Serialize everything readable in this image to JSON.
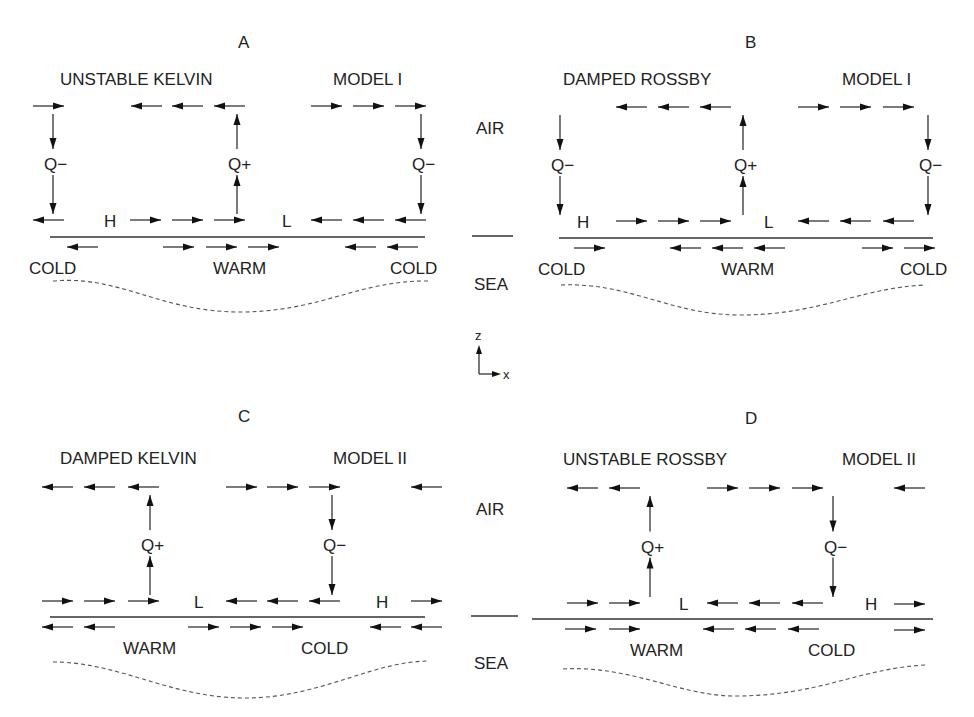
{
  "figure": {
    "center_labels": {
      "air_top": "AIR",
      "sea_top": "SEA",
      "air_bottom": "AIR",
      "sea_bottom": "SEA",
      "axis_z": "z",
      "axis_x": "x"
    },
    "panels": [
      {
        "id": "A",
        "letter": "A",
        "title": "UNSTABLE KELVIN",
        "model": "MODEL I",
        "origin": [
          0,
          0
        ],
        "letter_pos": [
          238,
          48
        ],
        "title_pos": [
          60,
          85
        ],
        "model_pos": [
          333,
          85
        ],
        "upper_arrows": [
          [
            33,
            106,
            "r"
          ],
          [
            131,
            106,
            "l"
          ],
          [
            172,
            106,
            "l"
          ],
          [
            214,
            106,
            "l"
          ],
          [
            311,
            106,
            "r"
          ],
          [
            353,
            106,
            "r"
          ],
          [
            395,
            106,
            "r"
          ]
        ],
        "verticals": [
          {
            "x": 53,
            "dir": "down",
            "label": "Q−"
          },
          {
            "x": 237,
            "dir": "up",
            "label": "Q+"
          },
          {
            "x": 421,
            "dir": "down",
            "label": "Q−"
          }
        ],
        "lower_air_arrows": [
          [
            33,
            220,
            "l"
          ],
          [
            130,
            220,
            "r"
          ],
          [
            172,
            220,
            "r"
          ],
          [
            214,
            220,
            "r"
          ],
          [
            311,
            220,
            "l"
          ],
          [
            353,
            220,
            "l"
          ],
          [
            395,
            220,
            "l"
          ]
        ],
        "pressure_labels": [
          {
            "text": "H",
            "x": 104
          },
          {
            "text": "L",
            "x": 282
          }
        ],
        "surface_line": [
          50,
          425
        ],
        "sea_arrows": [
          [
            67,
            247,
            "l"
          ],
          [
            163,
            247,
            "r"
          ],
          [
            206,
            247,
            "r"
          ],
          [
            248,
            247,
            "r"
          ],
          [
            345,
            247,
            "l"
          ],
          [
            387,
            247,
            "l"
          ]
        ],
        "sea_labels": [
          {
            "text": "COLD",
            "x": 29
          },
          {
            "text": "WARM",
            "x": 213
          },
          {
            "text": "COLD",
            "x": 390
          }
        ],
        "thermocline": "M53 281 C 120 275, 160 312, 240 312 C 320 312, 360 280, 428 281"
      },
      {
        "id": "B",
        "letter": "B",
        "title": "DAMPED ROSSBY",
        "model": "MODEL I",
        "origin": [
          0,
          0
        ],
        "letter_pos": [
          745,
          48
        ],
        "title_pos": [
          563,
          85
        ],
        "model_pos": [
          842,
          85
        ],
        "upper_arrows": [
          [
            616,
            107,
            "l"
          ],
          [
            658,
            107,
            "l"
          ],
          [
            700,
            107,
            "l"
          ],
          [
            798,
            107,
            "r"
          ],
          [
            840,
            107,
            "r"
          ],
          [
            883,
            107,
            "r"
          ]
        ],
        "verticals": [
          {
            "x": 560,
            "dir": "down",
            "label": "Q−"
          },
          {
            "x": 743,
            "dir": "up",
            "label": "Q+"
          },
          {
            "x": 928,
            "dir": "down",
            "label": "Q−"
          }
        ],
        "lower_air_arrows": [
          [
            616,
            221,
            "r"
          ],
          [
            658,
            221,
            "r"
          ],
          [
            700,
            221,
            "r"
          ],
          [
            798,
            221,
            "l"
          ],
          [
            840,
            221,
            "l"
          ],
          [
            883,
            221,
            "l"
          ]
        ],
        "pressure_labels": [
          {
            "text": "H",
            "x": 577
          },
          {
            "text": "L",
            "x": 764
          }
        ],
        "surface_line": [
          559,
          933
        ],
        "sea_arrows": [
          [
            574,
            248,
            "r"
          ],
          [
            670,
            248,
            "l"
          ],
          [
            712,
            248,
            "l"
          ],
          [
            754,
            248,
            "l"
          ],
          [
            862,
            248,
            "r"
          ],
          [
            904,
            248,
            "r"
          ]
        ],
        "sea_labels": [
          {
            "text": "COLD",
            "x": 538
          },
          {
            "text": "WARM",
            "x": 721
          },
          {
            "text": "COLD",
            "x": 900
          }
        ],
        "thermocline": "M561 285 C 630 282, 670 315, 740 315 C 820 315, 860 288, 925 285"
      },
      {
        "id": "C",
        "letter": "C",
        "title": "DAMPED KELVIN",
        "model": "MODEL II",
        "origin": [
          0,
          0
        ],
        "letter_pos": [
          238,
          422
        ],
        "title_pos": [
          60,
          464
        ],
        "model_pos": [
          333,
          464
        ],
        "upper_arrows": [
          [
            42,
            487,
            "l"
          ],
          [
            84,
            487,
            "l"
          ],
          [
            128,
            487,
            "l"
          ],
          [
            226,
            487,
            "r"
          ],
          [
            267,
            487,
            "r"
          ],
          [
            309,
            487,
            "r"
          ],
          [
            411,
            487,
            "l"
          ]
        ],
        "verticals": [
          {
            "x": 150,
            "dir": "up",
            "label": "Q+"
          },
          {
            "x": 332,
            "dir": "down",
            "label": "Q−"
          }
        ],
        "lower_air_arrows": [
          [
            42,
            601,
            "r"
          ],
          [
            84,
            601,
            "r"
          ],
          [
            128,
            601,
            "r"
          ],
          [
            226,
            601,
            "l"
          ],
          [
            267,
            601,
            "l"
          ],
          [
            309,
            601,
            "l"
          ],
          [
            411,
            601,
            "r"
          ]
        ],
        "pressure_labels": [
          {
            "text": "L",
            "x": 194
          },
          {
            "text": "H",
            "x": 376
          }
        ],
        "surface_line": [
          50,
          425
        ],
        "sea_arrows": [
          [
            42,
            627,
            "l"
          ],
          [
            84,
            627,
            "l"
          ],
          [
            188,
            627,
            "r"
          ],
          [
            230,
            627,
            "r"
          ],
          [
            272,
            627,
            "r"
          ],
          [
            370,
            627,
            "l"
          ],
          [
            411,
            627,
            "l"
          ]
        ],
        "sea_labels": [
          {
            "text": "WARM",
            "x": 123
          },
          {
            "text": "COLD",
            "x": 301
          }
        ],
        "thermocline": "M53 662 C 120 662, 170 698, 245 698 C 320 698, 370 662, 428 661"
      },
      {
        "id": "D",
        "letter": "D",
        "title": "UNSTABLE ROSSBY",
        "model": "MODEL II",
        "origin": [
          0,
          0
        ],
        "letter_pos": [
          745,
          424
        ],
        "title_pos": [
          563,
          465
        ],
        "model_pos": [
          842,
          465
        ],
        "upper_arrows": [
          [
            567,
            488,
            "l"
          ],
          [
            609,
            488,
            "l"
          ],
          [
            707,
            488,
            "r"
          ],
          [
            749,
            488,
            "r"
          ],
          [
            792,
            488,
            "r"
          ],
          [
            894,
            488,
            "l"
          ]
        ],
        "verticals": [
          {
            "x": 650,
            "dir": "up",
            "label": "Q+"
          },
          {
            "x": 833,
            "dir": "down",
            "label": "Q−"
          }
        ],
        "lower_air_arrows": [
          [
            567,
            603,
            "r"
          ],
          [
            609,
            603,
            "r"
          ],
          [
            707,
            603,
            "l"
          ],
          [
            749,
            603,
            "l"
          ],
          [
            792,
            603,
            "l"
          ],
          [
            894,
            604,
            "r"
          ]
        ],
        "pressure_labels": [
          {
            "text": "L",
            "x": 679
          },
          {
            "text": "H",
            "x": 865
          }
        ],
        "surface_line": [
          532,
          933
        ],
        "sea_arrows": [
          [
            565,
            629,
            "r"
          ],
          [
            609,
            629,
            "r"
          ],
          [
            703,
            629,
            "l"
          ],
          [
            745,
            629,
            "l"
          ],
          [
            788,
            629,
            "l"
          ],
          [
            894,
            630,
            "r"
          ]
        ],
        "sea_labels": [
          {
            "text": "WARM",
            "x": 630
          },
          {
            "text": "COLD",
            "x": 808
          }
        ],
        "thermocline": "M563 669 C 630 665, 680 696, 735 696 C 820 696, 860 668, 926 665"
      }
    ]
  }
}
